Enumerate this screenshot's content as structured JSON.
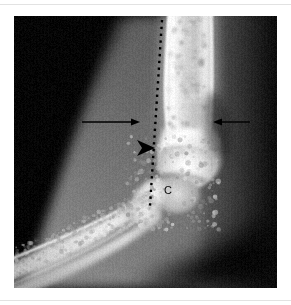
{
  "figure": {
    "modality": "radiograph",
    "view_description": "lateral elbow radiograph",
    "panel": {
      "x": 14,
      "y": 16,
      "width": 263,
      "height": 272
    },
    "background_color": "#ffffff",
    "rule_color": "#e2e2e2"
  },
  "annotations": {
    "labels": [
      {
        "id": "capitellum-label",
        "text": "C",
        "x": 150,
        "y": 169,
        "color": "#0a0a0a",
        "font_size": 11
      }
    ],
    "arrows": [
      {
        "id": "left-arrow",
        "direction": "right",
        "x1": 68,
        "y1": 106,
        "x2": 126,
        "y2": 106,
        "color": "#000000",
        "shaft_width": 1.4,
        "head_length": 9,
        "head_width": 7
      },
      {
        "id": "right-arrow",
        "direction": "left",
        "x1": 236,
        "y1": 106,
        "x2": 199,
        "y2": 106,
        "color": "#000000",
        "shaft_width": 1.4,
        "head_length": 9,
        "head_width": 7
      }
    ],
    "arrowheads": [
      {
        "id": "solid-arrowhead",
        "direction": "right",
        "tip_x": 141,
        "tip_y": 132,
        "length": 18,
        "width": 16,
        "notch": 5,
        "color": "#000000"
      }
    ],
    "dotted_lines": [
      {
        "id": "anterior-humeral-line",
        "x1": 148,
        "y1": 4,
        "x2": 136,
        "y2": 190,
        "color": "#000000",
        "dot_size": 2.4,
        "dot_gap": 4.4
      }
    ]
  },
  "radiograph_render": {
    "base_black": "#040404",
    "soft_tissue_mid": "#6f6f6f",
    "soft_tissue_dark": "#2a2a2a",
    "bone_bright": "#f2f2f2",
    "bone_mid": "#c9c9c9",
    "cortex_white": "#ffffff",
    "noise_opacity": 0.1,
    "regions": [
      {
        "name": "upper-left-void",
        "tone": "very-dark"
      },
      {
        "name": "anterior-soft-tissue",
        "tone": "mid-gray"
      },
      {
        "name": "posterior-soft-tissue",
        "tone": "dark-gray"
      },
      {
        "name": "humerus-shaft",
        "tone": "bright"
      },
      {
        "name": "distal-humerus-condyle",
        "tone": "bright"
      },
      {
        "name": "capitellum",
        "tone": "mid-bright"
      },
      {
        "name": "radius-shaft",
        "tone": "bright"
      },
      {
        "name": "ulna-shaft",
        "tone": "bright"
      },
      {
        "name": "olecranon",
        "tone": "bright"
      }
    ]
  }
}
